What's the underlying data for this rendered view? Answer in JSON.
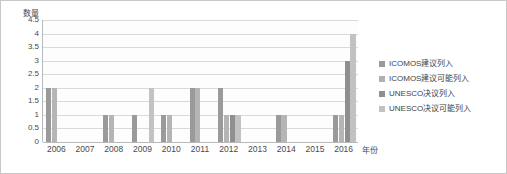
{
  "chart_data": {
    "type": "bar",
    "title": "",
    "subtitle": "",
    "xlabel": "年份",
    "ylabel": "数量",
    "grid": true,
    "legend_position": "right",
    "ylim": [
      0,
      4.5
    ],
    "yticks": [
      "4.5",
      "4",
      "3.5",
      "3",
      "2.5",
      "2",
      "1.5",
      "1",
      "0.5",
      "0"
    ],
    "ytick_values": [
      4.5,
      4,
      3.5,
      3,
      2.5,
      2,
      1.5,
      1,
      0.5,
      0
    ],
    "categories": [
      "2006",
      "2007",
      "2008",
      "2009",
      "2010",
      "2011",
      "2012",
      "2013",
      "2014",
      "2015",
      "2016"
    ],
    "series": [
      {
        "name": "ICOMOS建议列入",
        "color": "#9a9a9a",
        "values": [
          2,
          0,
          1,
          1,
          1,
          2,
          2,
          0,
          1,
          0,
          1
        ]
      },
      {
        "name": "ICOMOS建议可能列入",
        "color": "#b5b5b5",
        "values": [
          2,
          0,
          1,
          0,
          1,
          2,
          1,
          0,
          1,
          0,
          1
        ]
      },
      {
        "name": "UNESCO决议列入",
        "color": "#8f8f8f",
        "values": [
          0,
          0,
          0,
          0,
          0,
          0,
          1,
          0,
          0,
          0,
          3
        ]
      },
      {
        "name": "UNESCO决议可能列入",
        "color": "#c2c2c2",
        "values": [
          0,
          0,
          0,
          2,
          0,
          0,
          1,
          0,
          0,
          0,
          4
        ]
      }
    ]
  },
  "legend": {
    "items": [
      {
        "label": "ICOMOS建议列入",
        "color": "#9a9a9a"
      },
      {
        "label": "ICOMOS建议可能列入",
        "color": "#b0b0b0"
      },
      {
        "label": "UNESCO决议列入",
        "color": "#8f8f8f"
      },
      {
        "label": "UNESCO决议可能列入",
        "color": "#c2c2c2"
      }
    ]
  },
  "colors": {
    "grid": "#d9d9d9",
    "axis": "#b9b9b9",
    "text": "#4a4a4a",
    "plot_background": "#fdfdfd",
    "page_background": "#ffffff"
  }
}
